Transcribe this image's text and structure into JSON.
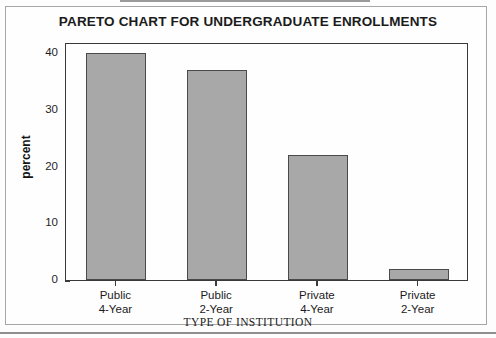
{
  "chart_data": {
    "type": "bar",
    "title": "PARETO CHART FOR UNDERGRADUATE ENROLLMENTS",
    "xlabel": "TYPE OF INSTITUTION",
    "ylabel": "percent",
    "categories": [
      "Public 4-Year",
      "Public 2-Year",
      "Private 4-Year",
      "Private 2-Year"
    ],
    "category_lines": [
      [
        "Public",
        "4-Year"
      ],
      [
        "Public",
        "2-Year"
      ],
      [
        "Private",
        "4-Year"
      ],
      [
        "Private",
        "2-Year"
      ]
    ],
    "values": [
      40,
      37,
      22,
      2
    ],
    "ylim": [
      0,
      42
    ],
    "yticks": [
      0,
      10,
      20,
      30,
      40
    ],
    "ytick_labels": [
      "0",
      "10",
      "20",
      "30",
      "40"
    ],
    "grid": false,
    "legend": false,
    "bar_fill_color": "#a8a8a8",
    "bar_edge_color": "#4a4a4a",
    "frame_color": "#3a3a3a",
    "background_color": "#fefefe"
  }
}
